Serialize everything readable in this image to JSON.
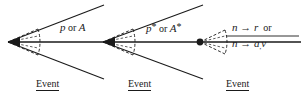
{
  "figure": {
    "background_color": "#ffffff",
    "line_color": "#1a1a1a",
    "width": 303,
    "height": 102
  },
  "axis": {
    "name": "horizontal-beam-axis",
    "y": 42,
    "x_start": 8,
    "x_end": 301
  },
  "vertices": [
    {
      "id": "vertex-1",
      "x": 8,
      "y": 42
    },
    {
      "id": "vertex-2",
      "x": 103,
      "y": 42
    },
    {
      "id": "vertex-3",
      "x": 200,
      "y": 42
    }
  ],
  "cones": [
    {
      "id": "wide-cone-1",
      "style": "solid",
      "apex_x": 8,
      "apex_y": 42,
      "tip_x": 104,
      "upper_tip_y": 5,
      "lower_tip_y": 79
    },
    {
      "id": "wide-cone-2",
      "style": "solid",
      "apex_x": 103,
      "apex_y": 42,
      "tip_x": 203,
      "upper_tip_y": 5,
      "lower_tip_y": 79
    }
  ],
  "dashed_cones": [
    {
      "id": "dashed-cone-1",
      "apex_x": 8,
      "apex_y": 42,
      "cap_x": 38,
      "half_height": 13
    },
    {
      "id": "dashed-cone-2",
      "apex_x": 103,
      "apex_y": 42,
      "cap_x": 133,
      "half_height": 13
    },
    {
      "id": "dashed-cone-3",
      "apex_x": 200,
      "apex_y": 42,
      "cap_x": 225,
      "half_height": 13
    }
  ],
  "labels": {
    "segment_1": {
      "name": "particle-label-1",
      "text_main": "p",
      "text_conjunction": "or",
      "text_alt": "A",
      "x": 60,
      "y": 28
    },
    "segment_2": {
      "name": "particle-label-2",
      "text_main": "p",
      "star": "*",
      "text_conjunction": "or",
      "text_alt": "A",
      "star_alt": "*",
      "x": 146,
      "y": 28
    },
    "segment_3_line_1": {
      "name": "decay-label-line-1",
      "text": "n",
      "arrow": "→",
      "product": "r",
      "conjunction": "or",
      "x": 232,
      "y": 27
    },
    "segment_3_line_2": {
      "name": "decay-label-line-2",
      "text": "n",
      "arrow": "→",
      "product": "a",
      "subscript": ",",
      "product2": "v",
      "x": 232,
      "y": 41
    }
  },
  "event_labels": [
    {
      "name": "event-label-1",
      "text": "Event",
      "x": 36,
      "y": 77
    },
    {
      "name": "event-label-2",
      "text": "Event",
      "x": 128,
      "y": 77
    },
    {
      "name": "event-label-3",
      "text": "Event",
      "x": 226,
      "y": 77
    }
  ]
}
